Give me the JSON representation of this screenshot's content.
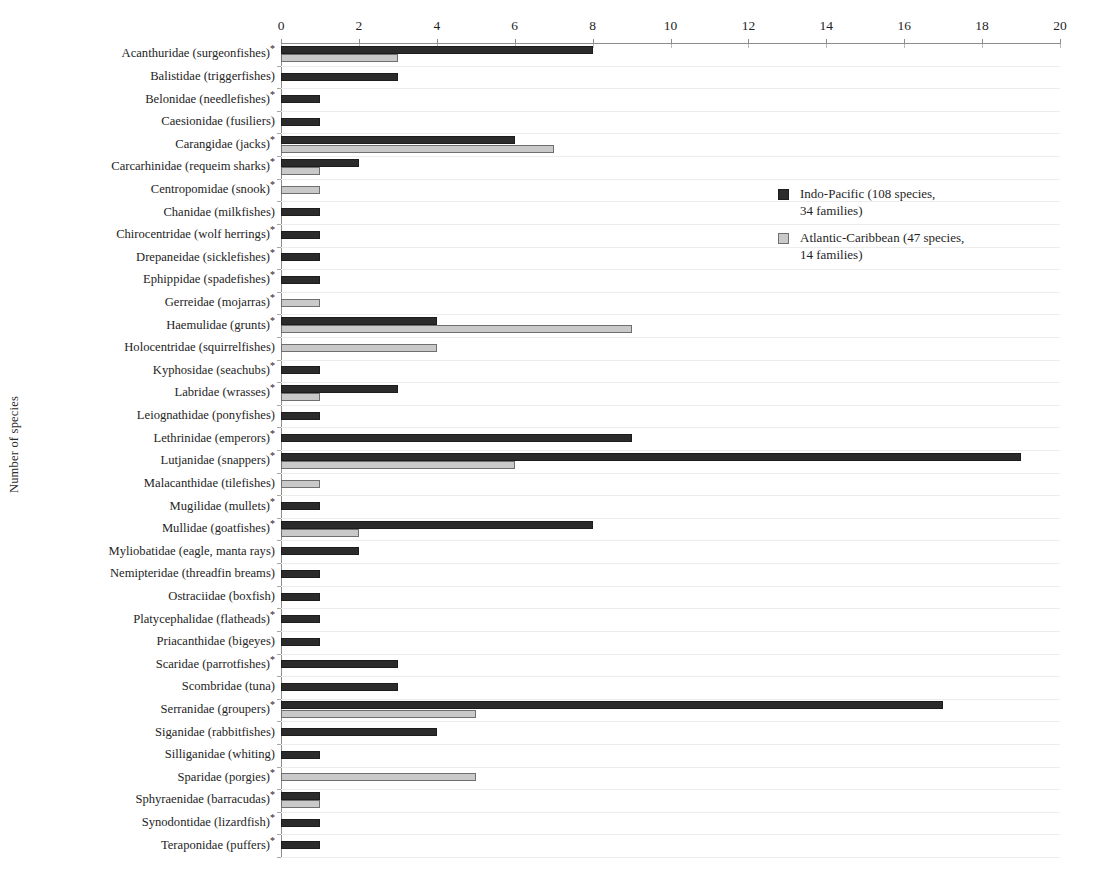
{
  "chart_data": {
    "type": "bar",
    "orientation": "horizontal",
    "title": "",
    "xlabel": "",
    "ylabel": "Number of species",
    "xlim": [
      0,
      20
    ],
    "xticks": [
      0,
      2,
      4,
      6,
      8,
      10,
      12,
      14,
      16,
      18,
      20
    ],
    "xtick_labels": [
      "0",
      "2",
      "4",
      "6",
      "8",
      "10",
      "12",
      "14",
      "16",
      "18",
      "20"
    ],
    "axis_position": "top",
    "grid": "horizontal",
    "legend_position": "center-right",
    "colors": {
      "indo_pacific": "#2b2b2b",
      "atlantic_caribbean": "#c9c9c9",
      "grid": "#ededed",
      "axis": "#8d8d8d"
    },
    "series": [
      {
        "name": "Indo-Pacific (108 species, 34 families)",
        "short_name": "Indo-Pacific",
        "color": "#2b2b2b",
        "species_total": 108,
        "families_total": 34,
        "values": [
          8,
          3,
          1,
          1,
          6,
          2,
          0,
          1,
          1,
          1,
          1,
          0,
          4,
          0,
          1,
          3,
          1,
          9,
          19,
          0,
          1,
          8,
          2,
          1,
          1,
          1,
          1,
          3,
          3,
          17,
          4,
          1,
          0,
          1,
          1,
          1
        ]
      },
      {
        "name": "Atlantic-Caribbean (47 species, 14 families)",
        "short_name": "Atlantic-Caribbean",
        "color": "#c9c9c9",
        "species_total": 47,
        "families_total": 14,
        "values": [
          3,
          0,
          0,
          0,
          7,
          1,
          1,
          0,
          0,
          0,
          0,
          1,
          9,
          4,
          0,
          1,
          0,
          0,
          6,
          1,
          0,
          2,
          0,
          0,
          0,
          0,
          0,
          0,
          0,
          5,
          0,
          0,
          5,
          1,
          0,
          0
        ]
      }
    ],
    "categories": [
      {
        "name": "Acanthuridae (surgeonfishes)",
        "starred": true
      },
      {
        "name": "Balistidae (triggerfishes)",
        "starred": false
      },
      {
        "name": "Belonidae (needlefishes)",
        "starred": true
      },
      {
        "name": "Caesionidae (fusiliers)",
        "starred": false
      },
      {
        "name": "Carangidae (jacks)",
        "starred": true
      },
      {
        "name": "Carcarhinidae (requeim sharks)",
        "starred": true
      },
      {
        "name": "Centropomidae (snook)",
        "starred": true
      },
      {
        "name": "Chanidae (milkfishes)",
        "starred": false
      },
      {
        "name": "Chirocentridae (wolf herrings)",
        "starred": true
      },
      {
        "name": "Drepaneidae (sicklefishes)",
        "starred": true
      },
      {
        "name": "Ephippidae (spadefishes)",
        "starred": true
      },
      {
        "name": "Gerreidae (mojarras)",
        "starred": true
      },
      {
        "name": "Haemulidae (grunts)",
        "starred": true
      },
      {
        "name": "Holocentridae (squirrelfishes)",
        "starred": false
      },
      {
        "name": "Kyphosidae (seachubs)",
        "starred": true
      },
      {
        "name": "Labridae (wrasses)",
        "starred": true
      },
      {
        "name": "Leiognathidae (ponyfishes)",
        "starred": false
      },
      {
        "name": "Lethrinidae (emperors)",
        "starred": true
      },
      {
        "name": "Lutjanidae (snappers)",
        "starred": true
      },
      {
        "name": "Malacanthidae (tilefishes)",
        "starred": false
      },
      {
        "name": "Mugilidae (mullets)",
        "starred": true
      },
      {
        "name": "Mullidae (goatfishes)",
        "starred": true
      },
      {
        "name": "Myliobatidae (eagle, manta rays)",
        "starred": false
      },
      {
        "name": "Nemipteridae (threadfin breams)",
        "starred": false
      },
      {
        "name": "Ostraciidae (boxfish)",
        "starred": false
      },
      {
        "name": "Platycephalidae (flatheads)",
        "starred": true
      },
      {
        "name": "Priacanthidae (bigeyes)",
        "starred": false
      },
      {
        "name": "Scaridae (parrotfishes)",
        "starred": true
      },
      {
        "name": "Scombridae (tuna)",
        "starred": false
      },
      {
        "name": "Serranidae (groupers)",
        "starred": true
      },
      {
        "name": "Siganidae (rabbitfishes)",
        "starred": false
      },
      {
        "name": "Silliganidae (whiting)",
        "starred": false
      },
      {
        "name": "Sparidae (porgies)",
        "starred": true
      },
      {
        "name": "Sphyraenidae (barracudas)",
        "starred": true
      },
      {
        "name": "Synodontidae (lizardfish)",
        "starred": true
      },
      {
        "name": "Teraponidae (puffers)",
        "starred": true
      }
    ]
  },
  "legend": {
    "entries": [
      {
        "line1": "Indo-Pacific (108 species,",
        "line2": "34 families)",
        "swatch": "dark"
      },
      {
        "line1": "Atlantic-Caribbean (47 species,",
        "line2": "14 families)",
        "swatch": "light"
      }
    ]
  },
  "axis": {
    "y_title": "Number of species"
  }
}
